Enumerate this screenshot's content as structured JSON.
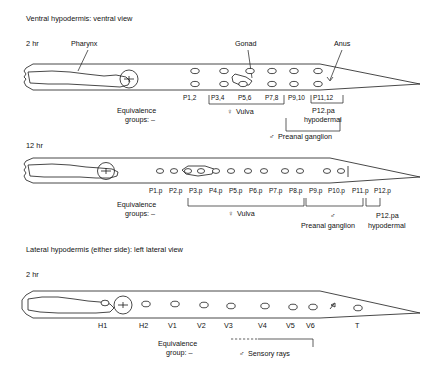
{
  "figure": {
    "background_color": "#ffffff",
    "ink_color": "#1a1a1a"
  },
  "panels": [
    {
      "id": "ventral",
      "section_title": "Ventral hypodermis:  ventral view",
      "time_label": "2 hr",
      "callouts": [
        {
          "name": "pharynx",
          "label": "Pharynx"
        },
        {
          "name": "gonad",
          "label": "Gonad"
        },
        {
          "name": "anus",
          "label": "Anus"
        }
      ],
      "equivalence_label_line1": "Equivalence",
      "equivalence_label_line2": "groups: –",
      "cell_labels": [
        "P1,2",
        "P3,4",
        "P5,6",
        "P7,8",
        "P9,10",
        "P11,12"
      ],
      "groups": [
        {
          "name": "vulva",
          "symbol": "♀",
          "label": "Vulva"
        },
        {
          "name": "preanal-ganglion",
          "symbol": "♂",
          "label": "Preanal ganglion"
        },
        {
          "name": "p12pa-hypodermal",
          "symbol": "",
          "label_line1": "P12.pa",
          "label_line2": "hypodermal"
        }
      ]
    },
    {
      "id": "ventral-12hr",
      "time_label": "12 hr",
      "equivalence_label_line1": "Equivalence",
      "equivalence_label_line2": "groups: –",
      "cell_labels": [
        "P1.p",
        "P2.p",
        "P3.p",
        "P4.p",
        "P5.p",
        "P6.p",
        "P7.p",
        "P8.p",
        "P9.p",
        "P10.p",
        "P11.p",
        "P12.p"
      ],
      "groups": [
        {
          "name": "vulva",
          "symbol": "♀",
          "label": "Vulva"
        },
        {
          "name": "preanal-ganglion",
          "symbol": "♂",
          "label": "Preanal ganglion"
        },
        {
          "name": "p12pa-hypodermal",
          "symbol": "",
          "label_line1": "P12.pa",
          "label_line2": "hypodermal"
        }
      ]
    },
    {
      "id": "lateral",
      "section_title": "Lateral hypodermis (either side):  left lateral view",
      "time_label": "2 hr",
      "equivalence_label_line1": "Equivalence",
      "equivalence_label_line2": "group: –",
      "cell_labels": [
        "H1",
        "H2",
        "V1",
        "V2",
        "V3",
        "V4",
        "V5",
        "V6",
        "T"
      ],
      "groups": [
        {
          "name": "sensory-rays",
          "symbol": "♂",
          "label": "Sensory rays"
        }
      ]
    }
  ]
}
